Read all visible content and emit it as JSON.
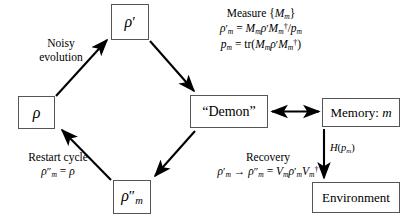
{
  "figure": {
    "name": "quantum-maxwell-demon-cycle",
    "background_color": "#ffffff",
    "line_color": "#000000",
    "box_border_color": "#555555",
    "width": 411,
    "height": 218
  },
  "nodes": {
    "rho": {
      "label": "ρ",
      "name": "state-rho"
    },
    "rho_prime": {
      "label": "ρ′",
      "name": "state-rho-prime"
    },
    "rho_double_prime": {
      "label": "ρ″m",
      "name": "state-rho-double-prime-m"
    },
    "demon": {
      "label": "“Demon”",
      "name": "demon-box"
    },
    "memory": {
      "label": "Memory: m",
      "name": "memory-box"
    },
    "environment": {
      "label": "Environment",
      "name": "environment-box"
    }
  },
  "labels": {
    "noisy_evolution": {
      "line1": "Noisy",
      "line2": "evolution"
    },
    "restart_cycle": {
      "line1": "Restart cycle",
      "line2": "ρ″m = ρ"
    },
    "measure": {
      "line1": "Measure {Mm}",
      "line2": "ρ′m = Mmρ′Mm†/pm",
      "line3": "pm = tr(Mmρ′Mm†)"
    },
    "recovery": {
      "line1": "Recovery",
      "line2": "ρ′m → ρ″m = Vmρ′mVm†"
    },
    "entropy": "H(pm)"
  },
  "arrows": [
    {
      "name": "arrow-rho-to-rho-prime",
      "from": "rho",
      "to": "rho_prime",
      "label": "noisy_evolution",
      "style": "single"
    },
    {
      "name": "arrow-rho-prime-to-demon",
      "from": "rho_prime",
      "to": "demon",
      "label": "measure",
      "style": "single"
    },
    {
      "name": "arrow-demon-to-memory",
      "from": "demon",
      "to": "memory",
      "label": null,
      "style": "double"
    },
    {
      "name": "arrow-demon-to-rho-double-prime",
      "from": "demon",
      "to": "rho_double_prime",
      "label": "recovery",
      "style": "single"
    },
    {
      "name": "arrow-rho-double-prime-to-rho",
      "from": "rho_double_prime",
      "to": "rho",
      "label": "restart_cycle",
      "style": "single"
    },
    {
      "name": "arrow-memory-to-environment",
      "from": "memory",
      "to": "environment",
      "label": "entropy",
      "style": "single"
    }
  ]
}
